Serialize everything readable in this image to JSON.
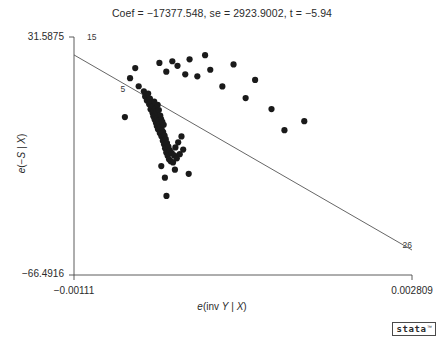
{
  "chart_data": {
    "type": "scatter",
    "title": "Coef = −17377.548, se = 2923.9002, t = −5.94",
    "xlabel": "e(inv Y | X)",
    "ylabel": "e(−S | X)",
    "xlim": [
      -0.00111,
      0.002809
    ],
    "ylim": [
      -66.4916,
      31.5875
    ],
    "grid": false,
    "legend": null,
    "xticks": [
      {
        "value": -0.00111,
        "label": "−0.00111"
      },
      {
        "value": 0.002809,
        "label": "0.002809"
      }
    ],
    "yticks": [
      {
        "value": 31.5875,
        "label": "31.5875"
      },
      {
        "value": -66.4916,
        "label": "−66.4916"
      }
    ],
    "fit_line": {
      "slope": -17377.548,
      "se": 2923.9002,
      "t": -5.94,
      "x0": -0.00111,
      "y0": 24.2,
      "x1": 0.002809,
      "y1": -56.2
    },
    "annotations": [
      {
        "text": "15",
        "x": -0.00096,
        "y": 31.3
      },
      {
        "text": "5",
        "x": -0.00057,
        "y": 9.6
      },
      {
        "text": "26",
        "x": 0.0027,
        "y": -54.5
      }
    ],
    "points": [
      {
        "x": -0.00052,
        "y": -1.4
      },
      {
        "x": -0.00036,
        "y": 11.3
      },
      {
        "x": -0.0003,
        "y": 9.2
      },
      {
        "x": -0.000285,
        "y": 7.1
      },
      {
        "x": -0.000265,
        "y": 5.4
      },
      {
        "x": -0.00025,
        "y": 8.3
      },
      {
        "x": -0.000238,
        "y": 3.9
      },
      {
        "x": -0.00023,
        "y": 6.2
      },
      {
        "x": -0.000222,
        "y": 1.8
      },
      {
        "x": -0.000215,
        "y": 4.8
      },
      {
        "x": -0.000208,
        "y": 2.6
      },
      {
        "x": -0.0002,
        "y": 0.4
      },
      {
        "x": -0.000196,
        "y": 3.2
      },
      {
        "x": -0.00019,
        "y": -1.1
      },
      {
        "x": -0.000185,
        "y": 1.2
      },
      {
        "x": -0.00018,
        "y": 5.0
      },
      {
        "x": -0.000175,
        "y": -2.4
      },
      {
        "x": -0.00017,
        "y": 2.1
      },
      {
        "x": -0.000166,
        "y": -0.3
      },
      {
        "x": -0.00016,
        "y": -3.7
      },
      {
        "x": -0.000155,
        "y": 0.9
      },
      {
        "x": -0.00015,
        "y": -5.1
      },
      {
        "x": -0.000146,
        "y": -1.9
      },
      {
        "x": -0.00014,
        "y": 3.6
      },
      {
        "x": -0.000136,
        "y": -6.4
      },
      {
        "x": -0.00013,
        "y": -2.8
      },
      {
        "x": -0.000126,
        "y": 1.5
      },
      {
        "x": -0.00012,
        "y": -4.3
      },
      {
        "x": -0.000115,
        "y": -8.0
      },
      {
        "x": -0.00011,
        "y": -0.8
      },
      {
        "x": -0.000105,
        "y": -5.6
      },
      {
        "x": -0.0001,
        "y": -2.2
      },
      {
        "x": -9.6e-05,
        "y": -9.3
      },
      {
        "x": -9e-05,
        "y": -6.9
      },
      {
        "x": -8.6e-05,
        "y": -3.4
      },
      {
        "x": -8e-05,
        "y": -11.2
      },
      {
        "x": -7.6e-05,
        "y": -7.6
      },
      {
        "x": -7e-05,
        "y": -4.6
      },
      {
        "x": -6.6e-05,
        "y": -12.6
      },
      {
        "x": -6e-05,
        "y": -9.0
      },
      {
        "x": -5.4e-05,
        "y": -14.3
      },
      {
        "x": -4.6e-05,
        "y": -10.5
      },
      {
        "x": -4e-05,
        "y": -16.0
      },
      {
        "x": -3.2e-05,
        "y": -12.1
      },
      {
        "x": -2.4e-05,
        "y": -17.4
      },
      {
        "x": -1.6e-05,
        "y": -13.6
      },
      {
        "x": -8e-06,
        "y": -18.8
      },
      {
        "x": 2e-06,
        "y": -15.1
      },
      {
        "x": 1.2e-05,
        "y": -19.6
      },
      {
        "x": 2.4e-05,
        "y": -16.3
      },
      {
        "x": 3.8e-05,
        "y": -20.1
      },
      {
        "x": 5.2e-05,
        "y": -17.2
      },
      {
        "x": 6.6e-05,
        "y": -13.9
      },
      {
        "x": 8.2e-05,
        "y": -18.4
      },
      {
        "x": 9.8e-05,
        "y": -11.8
      },
      {
        "x": 0.000116,
        "y": -16.7
      },
      {
        "x": 0.000136,
        "y": -9.4
      },
      {
        "x": 0.000156,
        "y": -14.8
      },
      {
        "x": -0.00046,
        "y": 14.6
      },
      {
        "x": -0.0004,
        "y": 18.8
      },
      {
        "x": -0.00012,
        "y": 20.9
      },
      {
        "x": -4e-05,
        "y": 17.3
      },
      {
        "x": 3e-05,
        "y": 21.6
      },
      {
        "x": 9e-05,
        "y": 19.7
      },
      {
        "x": 0.00018,
        "y": 16.2
      },
      {
        "x": 0.00023,
        "y": 22.4
      },
      {
        "x": 0.00032,
        "y": 15.4
      },
      {
        "x": 0.00041,
        "y": 24.1
      },
      {
        "x": 0.00047,
        "y": 18.1
      },
      {
        "x": 0.00061,
        "y": 11.2
      },
      {
        "x": 0.00074,
        "y": 20.3
      },
      {
        "x": 0.00088,
        "y": 6.4
      },
      {
        "x": 0.00099,
        "y": 13.9
      },
      {
        "x": 0.00118,
        "y": 1.9
      },
      {
        "x": 0.00133,
        "y": -6.8
      },
      {
        "x": 0.00156,
        "y": -3.1
      },
      {
        "x": -5.6e-05,
        "y": -26.4
      },
      {
        "x": -3.8e-05,
        "y": -33.9
      },
      {
        "x": 6e-05,
        "y": -23.1
      },
      {
        "x": -9.8e-05,
        "y": -21.6
      },
      {
        "x": 0.00022,
        "y": -24.8
      }
    ]
  },
  "branding": {
    "logo_text": "stata",
    "logo_tm": "™"
  }
}
